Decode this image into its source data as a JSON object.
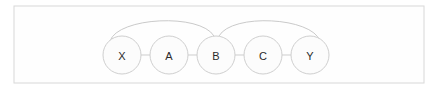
{
  "diagram": {
    "background_color": "#ffffff",
    "frame": {
      "x": 14,
      "y": 6,
      "width": 410,
      "height": 77,
      "fill": "#fefefe",
      "stroke": "#d8d8d8"
    },
    "node_style": {
      "radius": 19,
      "fill": "#fcfcfc",
      "stroke": "#cfcfcf",
      "label_color": "#2b2b2b"
    },
    "edge_style": {
      "stroke": "#cdcdcd",
      "arc_stroke": "#cacaca"
    },
    "nodes": [
      {
        "id": "X",
        "label": "X",
        "cx": 122,
        "cy": 55
      },
      {
        "id": "A",
        "label": "A",
        "cx": 169,
        "cy": 55
      },
      {
        "id": "B",
        "label": "B",
        "cx": 216,
        "cy": 55
      },
      {
        "id": "C",
        "label": "C",
        "cx": 263,
        "cy": 55
      },
      {
        "id": "Y",
        "label": "Y",
        "cx": 310,
        "cy": 55
      }
    ],
    "straight_edges": [
      {
        "from": "X",
        "to": "A",
        "x1": 141,
        "y1": 55,
        "x2": 150,
        "y2": 55
      },
      {
        "from": "A",
        "to": "B",
        "x1": 188,
        "y1": 55,
        "x2": 197,
        "y2": 55
      },
      {
        "from": "B",
        "to": "C",
        "x1": 235,
        "y1": 55,
        "x2": 244,
        "y2": 55
      },
      {
        "from": "C",
        "to": "Y",
        "x1": 282,
        "y1": 55,
        "x2": 291,
        "y2": 55
      }
    ],
    "arc_edges": [
      {
        "from": "X",
        "to": "B",
        "path": "M 110 41 C 118 17, 200 13, 214 36"
      },
      {
        "from": "B",
        "to": "Y",
        "path": "M 219 36 C 232 13, 312 17, 320 41"
      }
    ]
  }
}
